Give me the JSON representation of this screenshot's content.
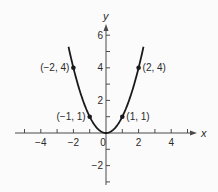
{
  "chart_data": {
    "type": "line",
    "title": "",
    "function": "y = x^2",
    "xlabel": "x",
    "ylabel": "y",
    "xlim": [
      -5.5,
      5.5
    ],
    "ylim": [
      -3.2,
      6.8
    ],
    "grid": false,
    "legend": null,
    "x_ticks": [
      -5,
      -4,
      -3,
      -2,
      -1,
      1,
      2,
      3,
      4,
      5
    ],
    "x_tick_labels": [
      {
        "value": -4,
        "label": "−4"
      },
      {
        "value": -2,
        "label": "−2"
      },
      {
        "value": 0,
        "label": "0"
      },
      {
        "value": 2,
        "label": "2"
      },
      {
        "value": 4,
        "label": "4"
      }
    ],
    "y_ticks": [
      -3,
      -2,
      -1,
      1,
      2,
      3,
      4,
      5,
      6
    ],
    "y_tick_labels": [
      {
        "value": 6,
        "label": "6"
      },
      {
        "value": 4,
        "label": "4"
      },
      {
        "value": 2,
        "label": "2"
      },
      {
        "value": -2,
        "label": "−2"
      }
    ],
    "curve_domain": [
      -2.3,
      2.3
    ],
    "points": [
      {
        "x": -2,
        "y": 4,
        "label": "(−2, 4)",
        "label_side": "left"
      },
      {
        "x": -1,
        "y": 1,
        "label": "(−1, 1)",
        "label_side": "left"
      },
      {
        "x": 1,
        "y": 1,
        "label": "(1, 1)",
        "label_side": "right"
      },
      {
        "x": 2,
        "y": 4,
        "label": "(2, 4)",
        "label_side": "right"
      }
    ]
  },
  "style": {
    "background": "#fbfbfb",
    "ink": "#2a2a2a",
    "curve_color": "#1a1a1a",
    "axis_color": "#4a4a4a"
  },
  "layout": {
    "origin_px": [
      106,
      133
    ],
    "unit_px": 16.3,
    "x_axis_px": [
      15,
      197
    ],
    "y_axis_px": [
      185,
      24
    ]
  }
}
